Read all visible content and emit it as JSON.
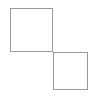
{
  "canvas": {
    "width": 96,
    "height": 98,
    "background_color": "#ffffff"
  },
  "figure": {
    "type": "geometric-diagram",
    "shape_count": 2,
    "stroke_color": "#9a9a9a",
    "stroke_width": 1,
    "fill": "none",
    "shared_corner": {
      "x": 53,
      "y": 52
    },
    "shapes": [
      {
        "name": "top-left-square",
        "kind": "square",
        "x": 10,
        "y": 8,
        "width": 43,
        "height": 44,
        "stroke_color": "#9a9a9a",
        "fill": "none"
      },
      {
        "name": "bottom-right-square",
        "kind": "square",
        "x": 53,
        "y": 52,
        "width": 35,
        "height": 38,
        "stroke_color": "#9a9a9a",
        "fill": "none"
      }
    ]
  }
}
